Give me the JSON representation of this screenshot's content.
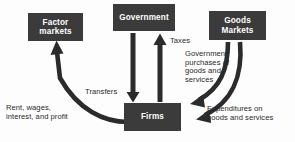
{
  "diagram": {
    "colors": {
      "box_fill": "#3b3b3b",
      "box_text": "#ffffff",
      "arrow": "#2b2b2b",
      "label_text": "#2a2a2a",
      "background": "#fdfdfd"
    },
    "nodes": [
      {
        "id": "factor-markets",
        "label": "Factor\nmarkets"
      },
      {
        "id": "government",
        "label": "Government"
      },
      {
        "id": "goods-markets",
        "label": "Goods\nMarkets"
      },
      {
        "id": "firms",
        "label": "Firms"
      }
    ],
    "flows": [
      {
        "id": "taxes",
        "label": "Taxes",
        "from": "firms",
        "to": "government",
        "arrow": "straight-up"
      },
      {
        "id": "transfers",
        "label": "Transfers",
        "from": "government",
        "to": "firms",
        "arrow": "straight-down"
      },
      {
        "id": "government-purchases",
        "label": "Government\npurchases of\ngoods and\nservices",
        "from": "goods-markets",
        "to": "firms",
        "arrow": "curved"
      },
      {
        "id": "expenditures",
        "label": "Expenditures on\ngoods and services",
        "from": "goods-markets",
        "to": "firms",
        "arrow": "curved"
      },
      {
        "id": "rent-wages-interest-profit",
        "label": "Rent, wages,\ninterest, and profit",
        "from": "firms",
        "to": "factor-markets",
        "arrow": "curved"
      }
    ]
  }
}
